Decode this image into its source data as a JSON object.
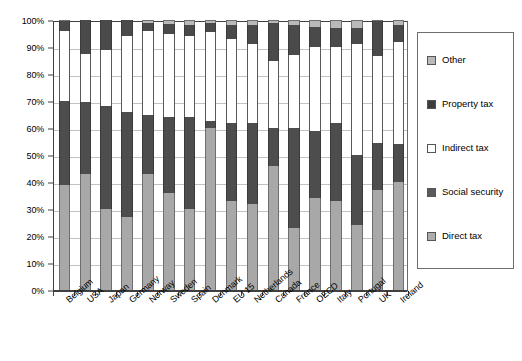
{
  "chart_data": {
    "type": "bar",
    "subtype": "stacked-100-percent",
    "title": "",
    "xlabel": "",
    "ylabel": "",
    "ylim": [
      0,
      100
    ],
    "y_unit": "%",
    "grid": true,
    "legend_position": "right",
    "categories": [
      "Belgium",
      "USA",
      "Japan",
      "Germany",
      "Norway",
      "Sweden",
      "Spain",
      "Denmark",
      "EU 15",
      "Netherlands",
      "Canada",
      "France",
      "OECD",
      "Italy",
      "Portugal",
      "UK",
      "Ireland"
    ],
    "y_ticks": [
      "0%",
      "10%",
      "20%",
      "30%",
      "40%",
      "50%",
      "60%",
      "70%",
      "80%",
      "90%",
      "100%"
    ],
    "y_tick_values": [
      0,
      10,
      20,
      30,
      40,
      50,
      60,
      70,
      80,
      90,
      100
    ],
    "series": [
      {
        "name": "Direct tax",
        "color": "#a8a8a8",
        "values": [
          39,
          43,
          30,
          27,
          43,
          36,
          30,
          60,
          33,
          32,
          46,
          23,
          34,
          33,
          24,
          37,
          40
        ]
      },
      {
        "name": "Social security",
        "color": "#4d4d4d",
        "values": [
          31,
          26.5,
          38,
          39,
          22,
          28,
          34,
          2.5,
          29,
          30,
          14,
          37,
          25,
          29,
          26,
          17.5,
          14
        ]
      },
      {
        "name": "Indirect tax",
        "color": "#ffffff",
        "values": [
          26,
          18,
          21,
          28,
          31,
          31,
          30,
          33,
          31,
          29,
          25,
          27,
          31,
          28,
          41,
          32,
          38
        ]
      },
      {
        "name": "Property tax",
        "color": "#4a4a4a",
        "values": [
          3.5,
          12.5,
          11,
          6,
          3,
          3.5,
          4,
          3.5,
          5,
          7,
          14,
          11,
          7.5,
          7,
          6,
          13,
          6
        ]
      },
      {
        "name": "Other",
        "color": "#b9b9b9",
        "values": [
          0.5,
          0,
          0,
          0,
          1,
          1.5,
          2,
          1,
          2,
          2,
          1,
          2,
          2.5,
          3,
          3,
          0.5,
          2
        ]
      }
    ]
  },
  "legend": {
    "items": [
      {
        "label": "Other",
        "swatch": "other-swatch-icon"
      },
      {
        "label": "Property tax",
        "swatch": "property-swatch-icon"
      },
      {
        "label": "Indirect tax",
        "swatch": "indirect-swatch-icon"
      },
      {
        "label": "Social security",
        "swatch": "social-swatch-icon"
      },
      {
        "label": "Direct tax",
        "swatch": "direct-swatch-icon"
      }
    ]
  }
}
